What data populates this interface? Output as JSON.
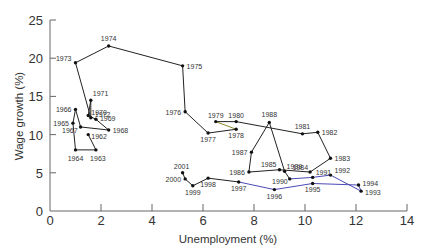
{
  "chart_data": {
    "type": "line",
    "title": "",
    "xlabel": "Unemployment (%)",
    "ylabel": "Wage growth (%)",
    "xlim": [
      0,
      14
    ],
    "ylim": [
      0,
      25
    ],
    "x_ticks": [
      0,
      2,
      4,
      6,
      8,
      10,
      12,
      14
    ],
    "y_ticks": [
      0,
      5,
      10,
      15,
      20,
      25
    ],
    "grid": false,
    "legend": null,
    "series": [
      {
        "name": "Wage growth vs unemployment by year",
        "points": [
          {
            "year": "1962",
            "x": 1.5,
            "y": 10.0
          },
          {
            "year": "1963",
            "x": 1.8,
            "y": 8.0
          },
          {
            "year": "1964",
            "x": 1.0,
            "y": 8.0
          },
          {
            "year": "1965",
            "x": 0.9,
            "y": 11.5
          },
          {
            "year": "1966",
            "x": 1.0,
            "y": 13.3
          },
          {
            "year": "1967",
            "x": 1.2,
            "y": 11.0
          },
          {
            "year": "1968",
            "x": 2.3,
            "y": 10.6
          },
          {
            "year": "1969",
            "x": 1.8,
            "y": 12.0
          },
          {
            "year": "1970",
            "x": 1.5,
            "y": 12.5
          },
          {
            "year": "1971",
            "x": 1.6,
            "y": 14.5
          },
          {
            "year": "1972",
            "x": 1.6,
            "y": 12.2
          },
          {
            "year": "1973",
            "x": 1.0,
            "y": 19.4
          },
          {
            "year": "1974",
            "x": 2.3,
            "y": 21.6
          },
          {
            "year": "1975",
            "x": 5.2,
            "y": 19.0
          },
          {
            "year": "1976",
            "x": 5.3,
            "y": 13.0
          },
          {
            "year": "1977",
            "x": 6.2,
            "y": 10.2
          },
          {
            "year": "1978",
            "x": 7.3,
            "y": 10.7
          },
          {
            "year": "1979",
            "x": 6.5,
            "y": 11.7
          },
          {
            "year": "1980",
            "x": 7.3,
            "y": 11.7
          },
          {
            "year": "1981",
            "x": 9.9,
            "y": 10.1
          },
          {
            "year": "1982",
            "x": 10.5,
            "y": 10.3
          },
          {
            "year": "1983",
            "x": 11.0,
            "y": 6.9
          },
          {
            "year": "1984",
            "x": 10.2,
            "y": 5.1
          },
          {
            "year": "1985",
            "x": 9.0,
            "y": 5.4
          },
          {
            "year": "1986",
            "x": 7.8,
            "y": 5.1
          },
          {
            "year": "1987",
            "x": 7.9,
            "y": 7.7
          },
          {
            "year": "1988",
            "x": 8.6,
            "y": 11.6
          },
          {
            "year": "1989",
            "x": 9.2,
            "y": 5.2
          },
          {
            "year": "1990",
            "x": 9.4,
            "y": 4.2
          },
          {
            "year": "1991",
            "x": 10.3,
            "y": 4.4
          },
          {
            "year": "1992",
            "x": 11.0,
            "y": 4.7
          },
          {
            "year": "1993",
            "x": 12.2,
            "y": 2.6
          },
          {
            "year": "1994",
            "x": 12.1,
            "y": 3.4
          },
          {
            "year": "1995",
            "x": 10.3,
            "y": 3.6
          },
          {
            "year": "1996",
            "x": 8.8,
            "y": 2.8
          },
          {
            "year": "1997",
            "x": 7.4,
            "y": 3.8
          },
          {
            "year": "1998",
            "x": 6.2,
            "y": 4.3
          },
          {
            "year": "1999",
            "x": 5.6,
            "y": 3.3
          },
          {
            "year": "2000",
            "x": 5.3,
            "y": 4.2
          },
          {
            "year": "2001",
            "x": 5.2,
            "y": 5.0
          }
        ],
        "label_offsets": {
          "1962": [
            3,
            4,
            "start"
          ],
          "1963": [
            2,
            11,
            "middle"
          ],
          "1964": [
            0,
            11,
            "middle"
          ],
          "1965": [
            -4,
            3,
            "end"
          ],
          "1966": [
            -4,
            3,
            "end"
          ],
          "1967": [
            -3,
            6,
            "end"
          ],
          "1968": [
            4,
            3,
            "start"
          ],
          "1969": [
            4,
            2,
            "start"
          ],
          "1970": [
            3,
            -1,
            "start"
          ],
          "1971": [
            2,
            -4,
            "start"
          ],
          "1972": [
            4,
            -1,
            "start"
          ],
          "1973": [
            -4,
            -2,
            "end"
          ],
          "1974": [
            0,
            -5,
            "middle"
          ],
          "1975": [
            4,
            3,
            "start"
          ],
          "1976": [
            -4,
            3,
            "end"
          ],
          "1977": [
            0,
            9,
            "middle"
          ],
          "1978": [
            0,
            9,
            "middle"
          ],
          "1979": [
            0,
            -4,
            "middle"
          ],
          "1980": [
            0,
            -4,
            "middle"
          ],
          "1981": [
            0,
            -5,
            "middle"
          ],
          "1982": [
            4,
            3,
            "start"
          ],
          "1983": [
            4,
            3,
            "start"
          ],
          "1984": [
            -2,
            -2,
            "end"
          ],
          "1985": [
            -3,
            -3,
            "end"
          ],
          "1986": [
            -4,
            3,
            "end"
          ],
          "1987": [
            -4,
            3,
            "end"
          ],
          "1988": [
            0,
            -5,
            "middle"
          ],
          "1989": [
            2,
            -2,
            "start"
          ],
          "1990": [
            -2,
            5,
            "end"
          ],
          "1991": [
            3,
            -2,
            "start"
          ],
          "1992": [
            4,
            -2,
            "start"
          ],
          "1993": [
            4,
            4,
            "start"
          ],
          "1994": [
            4,
            1,
            "start"
          ],
          "1995": [
            0,
            9,
            "middle"
          ],
          "1996": [
            0,
            9,
            "middle"
          ],
          "1997": [
            0,
            9,
            "middle"
          ],
          "1998": [
            0,
            9,
            "middle"
          ],
          "1999": [
            0,
            9,
            "middle"
          ],
          "2000": [
            -4,
            3,
            "end"
          ],
          "2001": [
            -1,
            -4,
            "middle"
          ]
        }
      }
    ],
    "colors": {
      "line": "#222222",
      "highlight_1990s": "#4a4ab8",
      "highlight_1978": "#8a8a30",
      "axis": "#666666",
      "text": "#333333"
    }
  }
}
